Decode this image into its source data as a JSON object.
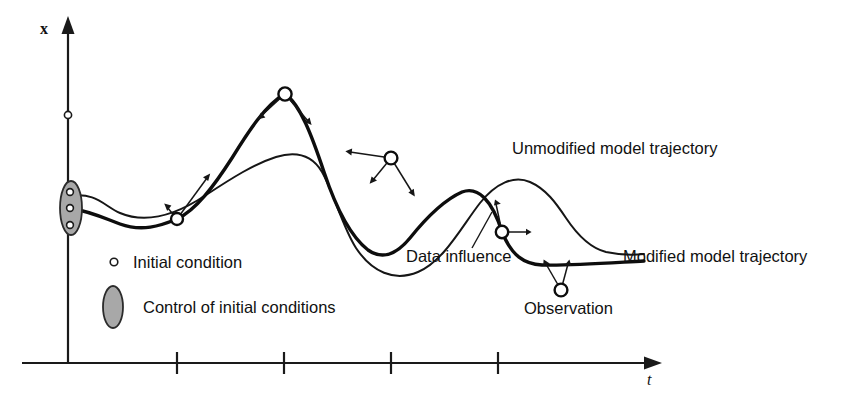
{
  "figure": {
    "axes": {
      "y_label": "x",
      "t_label": "t",
      "y_axis_tick_marker": "initial-condition-marker",
      "t_tick_count": 5
    },
    "callouts": [
      {
        "id": "unmodified",
        "text": "Unmodified model trajectory"
      },
      {
        "id": "modified",
        "text": "Modified model trajectory"
      },
      {
        "id": "data-influence",
        "text": "Data influence"
      },
      {
        "id": "observation",
        "text": "Observation"
      }
    ],
    "legend": [
      {
        "id": "initial-condition",
        "marker": "small-open-circle",
        "text": "Initial condition"
      },
      {
        "id": "control-of-initial-conditions",
        "marker": "gray-ellipse",
        "text": "Control of initial conditions"
      }
    ],
    "colors": {
      "ink": "#111111",
      "control_fill": "#a8a8a8",
      "background": "#ffffff"
    },
    "counts": {
      "initial_conditions_in_control": 3,
      "observations": 5,
      "trajectories": 2
    }
  }
}
